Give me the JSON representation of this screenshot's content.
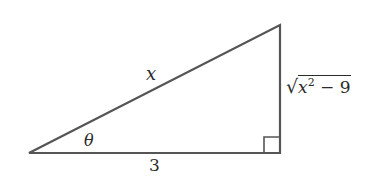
{
  "diagram": {
    "type": "right-triangle",
    "stroke_color": "#555555",
    "vertices": {
      "left": [
        29,
        153
      ],
      "right_bottom": [
        280,
        153
      ],
      "top": [
        280,
        25
      ]
    },
    "labels": {
      "hypotenuse": "x",
      "adjacent": "3",
      "angle": "θ",
      "opposite_radicand_base": "x",
      "opposite_exponent": "2",
      "opposite_rest": " − 9"
    },
    "right_angle_marker": true
  }
}
